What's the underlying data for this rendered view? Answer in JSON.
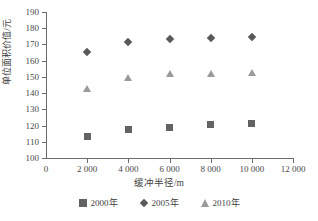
{
  "chart_data": {
    "type": "scatter",
    "title": "",
    "xlabel": "缓冲半径/m",
    "ylabel": "单位面积价值/元",
    "x": [
      2000,
      4000,
      6000,
      8000,
      10000
    ],
    "xlim": [
      0,
      12000
    ],
    "ylim": [
      100,
      190
    ],
    "xticks": [
      0,
      2000,
      4000,
      6000,
      8000,
      10000,
      12000
    ],
    "xtick_labels": [
      "0",
      "2 000",
      "4 000",
      "6 000",
      "8 000",
      "10 000",
      "12 000"
    ],
    "yticks": [
      100,
      110,
      120,
      130,
      140,
      150,
      160,
      170,
      180,
      190
    ],
    "ytick_labels": [
      "100",
      "110",
      "120",
      "130",
      "140",
      "150",
      "160",
      "170",
      "180",
      "190"
    ],
    "grid": false,
    "legend_position": "bottom-center",
    "series": [
      {
        "name": "2000年",
        "marker": "square",
        "color": "#636363",
        "values": [
          113.5,
          117.5,
          119.0,
          120.5,
          121.5
        ]
      },
      {
        "name": "2005年",
        "marker": "diamond",
        "color": "#595959",
        "values": [
          165.5,
          171.5,
          173.5,
          174.0,
          174.5
        ]
      },
      {
        "name": "2010年",
        "marker": "triangle",
        "color": "#9a9a9a",
        "values": [
          142.5,
          149.5,
          151.5,
          151.5,
          152.5
        ]
      }
    ]
  },
  "legend": {
    "items": [
      {
        "label": "2000年",
        "marker": "square"
      },
      {
        "label": "2005年",
        "marker": "diamond"
      },
      {
        "label": "2010年",
        "marker": "triangle"
      }
    ]
  }
}
